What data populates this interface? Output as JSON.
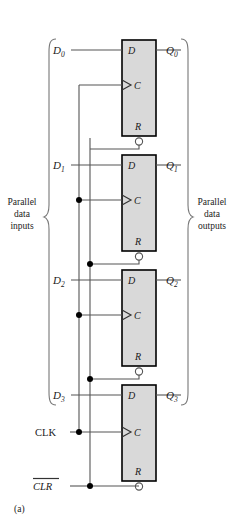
{
  "figure": {
    "caption": "(a)",
    "clock_label": "CLK",
    "clear_label": "CLR",
    "clear_overbar": true,
    "left_brace_label": {
      "line1": "Parallel",
      "line2": "data",
      "line3": "inputs"
    },
    "right_brace_label": {
      "line1": "Parallel",
      "line2": "data",
      "line3": "outputs"
    },
    "pin_labels": {
      "d": "D",
      "c": "C",
      "r": "R"
    },
    "stages": [
      {
        "index": 0,
        "input": "D",
        "input_sub": "0",
        "output": "Q",
        "output_sub": "0"
      },
      {
        "index": 1,
        "input": "D",
        "input_sub": "1",
        "output": "Q",
        "output_sub": "1"
      },
      {
        "index": 2,
        "input": "D",
        "input_sub": "2",
        "output": "Q",
        "output_sub": "2"
      },
      {
        "index": 3,
        "input": "D",
        "input_sub": "3",
        "output": "Q",
        "output_sub": "3"
      }
    ],
    "colors": {
      "block_fill": "#d9d9d9",
      "block_stroke": "#000000",
      "wire": "#555555",
      "text": "#1a1a1a",
      "background": "#ffffff"
    }
  }
}
